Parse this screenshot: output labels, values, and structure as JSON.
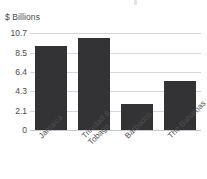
{
  "chart_data": {
    "type": "bar",
    "title": "",
    "subtitle": "",
    "xlabel": "",
    "ylabel": "$ Billions",
    "categories": [
      "Jamaica",
      "Trinidad & Tobago",
      "Barbados",
      "The Bahamas"
    ],
    "category_lines": [
      [
        "Jamaica"
      ],
      [
        "Trinidad &",
        "Tobago"
      ],
      [
        "Barbados"
      ],
      [
        "The Bahamas"
      ]
    ],
    "values": [
      9.3,
      10.1,
      2.9,
      5.4
    ],
    "ylim": [
      0,
      10.7
    ],
    "yticks": [
      10.7,
      8.5,
      6.4,
      4.3,
      2.1,
      0
    ],
    "ytick_labels": [
      "10.7",
      "8.5",
      "6.4",
      "4.3",
      "2.1",
      "0"
    ],
    "grid": true,
    "legend": false,
    "legend_position": "none",
    "bar_color": "#333335",
    "grid_color": "#d7d7d9",
    "text_color": "#4a4a4a",
    "background_color": "#ffffff",
    "xtick_rotation_deg": -45
  },
  "axis": {
    "unit_label": "$ Billions"
  }
}
